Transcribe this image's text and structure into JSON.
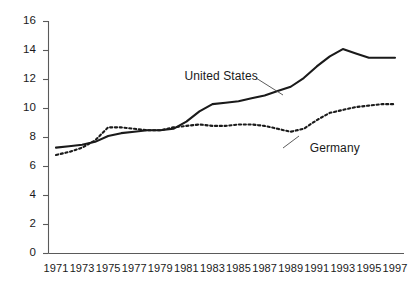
{
  "chart_data": {
    "type": "line",
    "title": "",
    "subtitle": "",
    "xlabel": "",
    "ylabel": "",
    "xlim": [
      1971,
      1997
    ],
    "ylim": [
      0,
      16
    ],
    "grid": false,
    "legend_position": "inline-annotation",
    "y_ticks": [
      0,
      2,
      4,
      6,
      8,
      10,
      12,
      14,
      16
    ],
    "y_tick_labels": [
      "0",
      "2",
      "4",
      "6",
      "8",
      "10",
      "12",
      "14",
      "16"
    ],
    "x_ticks": [
      1971,
      1973,
      1975,
      1977,
      1979,
      1981,
      1983,
      1985,
      1987,
      1989,
      1991,
      1993,
      1995,
      1997
    ],
    "x_tick_labels": [
      "1971",
      "1973",
      "1975",
      "1977",
      "1979",
      "1981",
      "1983",
      "1985",
      "1987",
      "1989",
      "1991",
      "1993",
      "1995",
      "1997"
    ],
    "x": [
      1971,
      1972,
      1973,
      1974,
      1975,
      1976,
      1977,
      1978,
      1979,
      1980,
      1981,
      1982,
      1983,
      1984,
      1985,
      1986,
      1987,
      1988,
      1989,
      1990,
      1991,
      1992,
      1993,
      1994,
      1995,
      1996,
      1997
    ],
    "series": [
      {
        "name": "United States",
        "style": "solid",
        "color": "#1a1a1a",
        "values": [
          7.3,
          7.4,
          7.5,
          7.7,
          8.1,
          8.3,
          8.4,
          8.5,
          8.5,
          8.6,
          9.1,
          9.8,
          10.3,
          10.4,
          10.5,
          10.7,
          10.9,
          11.2,
          11.5,
          12.1,
          12.9,
          13.6,
          14.1,
          13.8,
          13.5,
          13.5,
          13.5
        ]
      },
      {
        "name": "Germany",
        "style": "dotted",
        "color": "#1a1a1a",
        "values": [
          6.8,
          7.0,
          7.3,
          7.8,
          8.7,
          8.7,
          8.6,
          8.5,
          8.5,
          8.7,
          8.8,
          8.9,
          8.8,
          8.8,
          8.9,
          8.9,
          8.8,
          8.6,
          8.4,
          8.6,
          9.2,
          9.7,
          9.9,
          10.1,
          10.2,
          10.3,
          10.3
        ]
      }
    ],
    "annotations": [
      {
        "text": "United States",
        "series": "United States",
        "x": 1982,
        "y": 12.2
      },
      {
        "text": "Germany",
        "series": "Germany",
        "x": 1990,
        "y": 7.2
      }
    ]
  }
}
